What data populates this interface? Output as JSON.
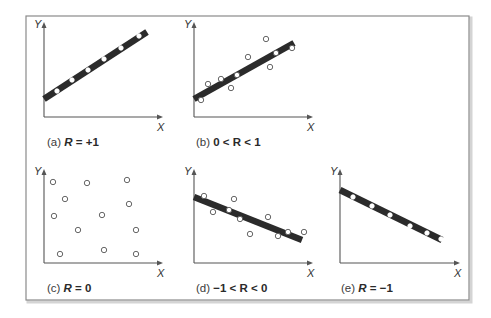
{
  "figure": {
    "frame": {
      "x": 26,
      "y": 16,
      "width": 443,
      "height": 284,
      "border_color": "#8a8a8a",
      "shadow_color": "#d4d4d4"
    },
    "colors": {
      "line": "#2b2b2b",
      "axis": "#555555",
      "point_stroke": "#555555",
      "point_fill": "#ffffff"
    },
    "axis_labels": {
      "x": "X",
      "y": "Y"
    }
  },
  "chart_data": [
    {
      "id": "a",
      "type": "scatter",
      "caption_prefix": "(a) ",
      "caption_main": "R = +1",
      "caption_italic": true,
      "axes": {
        "ox": 44,
        "oy": 117,
        "xend": 163,
        "ytop": 22
      },
      "fit_line": {
        "x1": 44,
        "y1": 99,
        "x2": 147,
        "y2": 32
      },
      "points": [
        [
          57,
          91
        ],
        [
          72,
          80
        ],
        [
          88,
          70
        ],
        [
          104,
          59
        ],
        [
          121,
          48
        ],
        [
          139,
          36
        ]
      ],
      "points_on_line": true,
      "caption_pos": {
        "x": 47,
        "y": 146
      }
    },
    {
      "id": "b",
      "type": "scatter",
      "caption_prefix": "(b) ",
      "caption_main": "0 < R < 1",
      "caption_italic": false,
      "axes": {
        "ox": 194,
        "oy": 117,
        "xend": 313,
        "ytop": 22
      },
      "fit_line": {
        "x1": 194,
        "y1": 99,
        "x2": 294,
        "y2": 43
      },
      "points": [
        [
          201,
          100
        ],
        [
          208,
          84
        ],
        [
          221,
          79
        ],
        [
          231,
          88
        ],
        [
          237,
          75
        ],
        [
          248,
          57
        ],
        [
          266,
          39
        ],
        [
          270,
          67
        ],
        [
          276,
          53
        ],
        [
          292,
          48
        ]
      ],
      "points_on_line": false,
      "caption_pos": {
        "x": 196,
        "y": 146
      }
    },
    {
      "id": "c",
      "type": "scatter",
      "caption_prefix": "(c) ",
      "caption_main": "R = 0",
      "caption_italic": true,
      "axes": {
        "ox": 44,
        "oy": 263,
        "xend": 163,
        "ytop": 169
      },
      "fit_line": null,
      "points": [
        [
          53,
          182
        ],
        [
          87,
          183
        ],
        [
          127,
          180
        ],
        [
          65,
          199
        ],
        [
          129,
          204
        ],
        [
          54,
          216
        ],
        [
          102,
          215
        ],
        [
          78,
          230
        ],
        [
          136,
          230
        ],
        [
          60,
          254
        ],
        [
          104,
          250
        ],
        [
          136,
          254
        ]
      ],
      "points_on_line": false,
      "caption_pos": {
        "x": 47,
        "y": 292
      }
    },
    {
      "id": "d",
      "type": "scatter",
      "caption_prefix": "(d) ",
      "caption_main": "−1 < R < 0",
      "caption_italic": false,
      "axes": {
        "ox": 194,
        "oy": 263,
        "xend": 313,
        "ytop": 169
      },
      "fit_line": {
        "x1": 194,
        "y1": 197,
        "x2": 302,
        "y2": 240
      },
      "points": [
        [
          204,
          196
        ],
        [
          213,
          212
        ],
        [
          234,
          199
        ],
        [
          229,
          210
        ],
        [
          240,
          219
        ],
        [
          250,
          234
        ],
        [
          268,
          217
        ],
        [
          278,
          236
        ],
        [
          288,
          232
        ],
        [
          304,
          232
        ]
      ],
      "points_on_line": false,
      "caption_pos": {
        "x": 196,
        "y": 292
      }
    },
    {
      "id": "e",
      "type": "scatter",
      "caption_prefix": "(e) ",
      "caption_main": "R = −1",
      "caption_italic": true,
      "axes": {
        "ox": 340,
        "oy": 263,
        "xend": 460,
        "ytop": 169
      },
      "fit_line": {
        "x1": 340,
        "y1": 190,
        "x2": 442,
        "y2": 240
      },
      "points": [
        [
          353,
          197
        ],
        [
          372,
          206
        ],
        [
          390,
          215
        ],
        [
          410,
          226
        ],
        [
          427,
          233
        ],
        [
          441,
          239
        ]
      ],
      "points_on_line": true,
      "caption_pos": {
        "x": 341,
        "y": 292
      }
    }
  ]
}
